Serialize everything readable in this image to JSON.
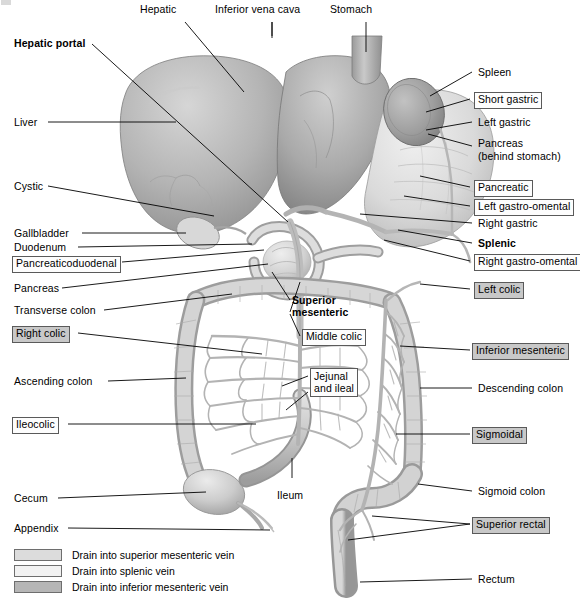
{
  "figure": {
    "background_color": "#ffffff",
    "illustration_style": "grayscale anatomical airbrush illustration"
  },
  "colors": {
    "leader_line": "#000000",
    "box_border": "#5a5a5a",
    "box_gray_fill": "#c8c8c8",
    "box_white_fill": "#fdfdfd",
    "organ_light": "#e4e4e4",
    "organ_mid": "#bdbdbd",
    "organ_dark": "#8f8f8f",
    "vessel": "#a8a8a8"
  },
  "labels": [
    {
      "id": "hepatic",
      "text": "Hepatic",
      "style": "plain",
      "align": "left",
      "x": 140,
      "y": 10
    },
    {
      "id": "inferior-vena-cava",
      "text": "Inferior vena cava",
      "style": "plain",
      "align": "left",
      "x": 215,
      "y": 10
    },
    {
      "id": "stomach",
      "text": "Stomach",
      "style": "plain",
      "align": "left",
      "x": 330,
      "y": 10
    },
    {
      "id": "hepatic-portal",
      "text": "Hepatic portal",
      "style": "bold",
      "align": "left",
      "x": 14,
      "y": 38
    },
    {
      "id": "spleen",
      "text": "Spleen",
      "style": "plain",
      "align": "left",
      "x": 478,
      "y": 67
    },
    {
      "id": "short-gastric",
      "text": "Short gastric",
      "style": "box-white",
      "align": "left",
      "x": 474,
      "y": 93
    },
    {
      "id": "liver",
      "text": "Liver",
      "style": "plain",
      "align": "left",
      "x": 14,
      "y": 117
    },
    {
      "id": "left-gastric",
      "text": "Left gastric",
      "style": "plain",
      "align": "left",
      "x": 478,
      "y": 117
    },
    {
      "id": "pancreas-right",
      "text": "Pancreas",
      "style": "plain",
      "align": "left",
      "x": 478,
      "y": 138
    },
    {
      "id": "behind-stomach",
      "text": "(behind stomach)",
      "style": "plain",
      "align": "left",
      "x": 478,
      "y": 150
    },
    {
      "id": "cystic",
      "text": "Cystic",
      "style": "plain",
      "align": "left",
      "x": 14,
      "y": 181
    },
    {
      "id": "pancreatic",
      "text": "Pancreatic",
      "style": "box-white",
      "align": "left",
      "x": 474,
      "y": 181
    },
    {
      "id": "left-gastro-omental",
      "text": "Left gastro-omental",
      "style": "box-white",
      "align": "left",
      "x": 474,
      "y": 200
    },
    {
      "id": "right-gastric",
      "text": "Right gastric",
      "style": "plain",
      "align": "left",
      "x": 478,
      "y": 218
    },
    {
      "id": "gallbladder",
      "text": "Gallbladder",
      "style": "plain",
      "align": "left",
      "x": 14,
      "y": 228
    },
    {
      "id": "duodenum",
      "text": "Duodenum",
      "style": "plain",
      "align": "left",
      "x": 14,
      "y": 242
    },
    {
      "id": "splenic",
      "text": "Splenic",
      "style": "bold",
      "align": "left",
      "x": 478,
      "y": 238
    },
    {
      "id": "pancreaticoduodenal",
      "text": "Pancreaticoduodenal",
      "style": "box-white",
      "align": "left",
      "x": 12,
      "y": 257
    },
    {
      "id": "right-gastro-omental",
      "text": "Right gastro-omental",
      "style": "box-white",
      "align": "left",
      "x": 474,
      "y": 255
    },
    {
      "id": "pancreas-left",
      "text": "Pancreas",
      "style": "plain",
      "align": "left",
      "x": 14,
      "y": 283
    },
    {
      "id": "left-colic",
      "text": "Left colic",
      "style": "box-gray",
      "align": "left",
      "x": 474,
      "y": 283
    },
    {
      "id": "superior-mesenteric",
      "text": "Superior",
      "style": "bold",
      "align": "left",
      "x": 292,
      "y": 296
    },
    {
      "id": "superior-mesenteric2",
      "text": "mesenteric",
      "style": "bold",
      "align": "left",
      "x": 292,
      "y": 308
    },
    {
      "id": "transverse-colon",
      "text": "Transverse colon",
      "style": "plain",
      "align": "left",
      "x": 14,
      "y": 305
    },
    {
      "id": "right-colic",
      "text": "Right colic",
      "style": "box-gray",
      "align": "left",
      "x": 12,
      "y": 327
    },
    {
      "id": "middle-colic",
      "text": "Middle colic",
      "style": "box-white",
      "align": "left",
      "x": 302,
      "y": 330
    },
    {
      "id": "inferior-mesenteric",
      "text": "Inferior mesenteric",
      "style": "box-gray",
      "align": "left",
      "x": 472,
      "y": 344
    },
    {
      "id": "ascending-colon",
      "text": "Ascending colon",
      "style": "plain",
      "align": "left",
      "x": 14,
      "y": 376
    },
    {
      "id": "jejunal",
      "text": "Jejunal",
      "style": "box-white-2",
      "align": "left",
      "x": 310,
      "y": 370
    },
    {
      "id": "descending-colon",
      "text": "Descending colon",
      "style": "plain",
      "align": "left",
      "x": 478,
      "y": 383
    },
    {
      "id": "ileocolic",
      "text": "Ileocolic",
      "style": "box-white",
      "align": "left",
      "x": 12,
      "y": 418
    },
    {
      "id": "sigmoidal",
      "text": "Sigmoidal",
      "style": "box-gray",
      "align": "left",
      "x": 472,
      "y": 428
    },
    {
      "id": "ileum",
      "text": "Ileum",
      "style": "plain",
      "align": "left",
      "x": 277,
      "y": 490
    },
    {
      "id": "cecum",
      "text": "Cecum",
      "style": "plain",
      "align": "left",
      "x": 14,
      "y": 493
    },
    {
      "id": "sigmoid-colon",
      "text": "Sigmoid colon",
      "style": "plain",
      "align": "left",
      "x": 478,
      "y": 486
    },
    {
      "id": "appendix",
      "text": "Appendix",
      "style": "plain",
      "align": "left",
      "x": 14,
      "y": 523
    },
    {
      "id": "superior-rectal",
      "text": "Superior rectal",
      "style": "box-gray",
      "align": "left",
      "x": 472,
      "y": 518
    },
    {
      "id": "rectum",
      "text": "Rectum",
      "style": "plain",
      "align": "left",
      "x": 478,
      "y": 574
    }
  ],
  "jejunal_second_line": "and ileal",
  "legend": {
    "rows": [
      {
        "id": "superior-mesenteric-vein",
        "swatch_color": "#dcdcdc",
        "text": "Drain into superior mesenteric vein"
      },
      {
        "id": "splenic-vein",
        "swatch_color": "#f2f2f2",
        "text": "Drain into splenic vein"
      },
      {
        "id": "inferior-mesenteric-vein",
        "swatch_color": "#b6b6b6",
        "text": "Drain into inferior mesenteric vein"
      }
    ]
  }
}
